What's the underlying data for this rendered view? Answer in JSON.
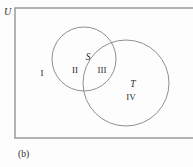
{
  "figure": {
    "caption": "(b)",
    "type": "venn-diagram",
    "background_color": "#fdfdfd",
    "stroke_color": "#8f8f8f",
    "text_color": "#2b2b2b"
  },
  "universe": {
    "label": "U",
    "rect": {
      "x": 15,
      "y": 8,
      "width": 182,
      "height": 130
    }
  },
  "sets": [
    {
      "id": "S",
      "label": "S",
      "label_x": 88,
      "label_y": 60,
      "cx": 84,
      "cy": 59,
      "r": 32
    },
    {
      "id": "T",
      "label": "T",
      "label_x": 133,
      "label_y": 87,
      "cx": 126,
      "cy": 83,
      "r": 43
    }
  ],
  "regions": [
    {
      "id": "region-1",
      "label": "I",
      "x": 42,
      "y": 76,
      "description": "outside both sets"
    },
    {
      "id": "region-2",
      "label": "II",
      "x": 75,
      "y": 73,
      "description": "S only"
    },
    {
      "id": "region-3",
      "label": "III",
      "x": 102,
      "y": 73,
      "description": "S intersect T"
    },
    {
      "id": "region-4",
      "label": "IV",
      "x": 131,
      "y": 100,
      "description": "T only"
    }
  ]
}
